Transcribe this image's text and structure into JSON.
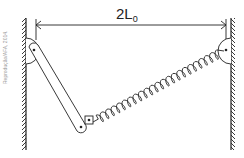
{
  "diagram": {
    "dimension_label": "2L",
    "dimension_subscript": "0",
    "watermark": "Reprodução/AFA, 2014.",
    "components": [
      "left-wall",
      "right-wall",
      "rigid-rod",
      "spring",
      "left-pivot",
      "right-pivot",
      "sliding-block"
    ],
    "colors": {
      "stroke": "#222222",
      "background": "#ffffff",
      "watermark": "#9a9a9a"
    }
  }
}
